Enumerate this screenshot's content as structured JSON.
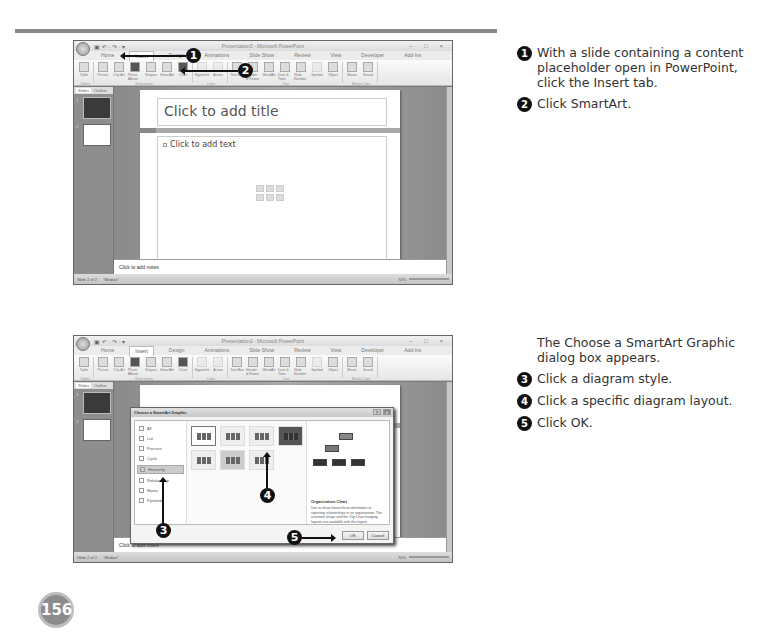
{
  "page": {
    "number": "156"
  },
  "screenshot1": {
    "window_title": "Presentation3 - Microsoft PowerPoint",
    "qat": "▣ ↶ · ↷ · ▾",
    "win_controls": "– □ ×",
    "tabs": [
      "Home",
      "Insert",
      "Design",
      "Animations",
      "Slide Show",
      "Review",
      "View",
      "Developer",
      "Add-Ins"
    ],
    "active_tab": "Insert",
    "ribbon_groups": [
      {
        "label": "Tables",
        "buttons": [
          "Table"
        ]
      },
      {
        "label": "Illustrations",
        "buttons": [
          "Picture",
          "Clip Art",
          "Photo Album",
          "Shapes",
          "SmartArt",
          "Chart"
        ]
      },
      {
        "label": "Links",
        "buttons": [
          "Hyperlink",
          "Action"
        ]
      },
      {
        "label": "Text",
        "buttons": [
          "Text Box",
          "Header & Footer",
          "WordArt",
          "Date & Time",
          "Slide Number",
          "Symbol",
          "Object"
        ]
      },
      {
        "label": "Media Clips",
        "buttons": [
          "Movie",
          "Sound"
        ]
      }
    ],
    "pane_tabs": [
      "Slides",
      "Outline"
    ],
    "slide_numbers": [
      "1",
      "2"
    ],
    "slide_title_placeholder": "Click to add title",
    "slide_content_placeholder": "Click to add text",
    "notes_placeholder": "Click to add notes",
    "status": {
      "slide_info": "Slide 2 of 2",
      "theme": "\"Median\"",
      "zoom": "70%"
    },
    "markers": [
      "1",
      "2"
    ]
  },
  "screenshot2": {
    "window_title": "Presentation3 - Microsoft PowerPoint",
    "tabs": [
      "Home",
      "Insert",
      "Design",
      "Animations",
      "Slide Show",
      "Review",
      "View",
      "Developer",
      "Add-Ins"
    ],
    "active_tab": "Insert",
    "dialog": {
      "title": "Choose a SmartArt Graphic",
      "help": "?",
      "close": "×",
      "categories": [
        "All",
        "List",
        "Process",
        "Cycle",
        "Hierarchy",
        "Relationship",
        "Matrix",
        "Pyramid"
      ],
      "selected_category": "Hierarchy",
      "preview_title": "Organization Chart",
      "preview_description": "Use to show hierarchical information or reporting relationships in an organization. The assistant shape and the Org Chart hanging layouts are available with this layout.",
      "ok_label": "OK",
      "cancel_label": "Cancel"
    },
    "notes_placeholder": "Click to add notes",
    "status": {
      "slide_info": "Slide 2 of 2",
      "theme": "\"Median\"",
      "zoom": "70%"
    },
    "markers": [
      "3",
      "4",
      "5"
    ]
  },
  "instructions": {
    "group1": [
      {
        "num": "1",
        "text": "With a slide containing a content placeholder open in PowerPoint, click the Insert tab."
      },
      {
        "num": "2",
        "text": "Click SmartArt."
      }
    ],
    "intro2": "The Choose a SmartArt Graphic dialog box appears.",
    "group2": [
      {
        "num": "3",
        "text": "Click a diagram style."
      },
      {
        "num": "4",
        "text": "Click a specific diagram layout."
      },
      {
        "num": "5",
        "text": "Click OK."
      }
    ]
  }
}
